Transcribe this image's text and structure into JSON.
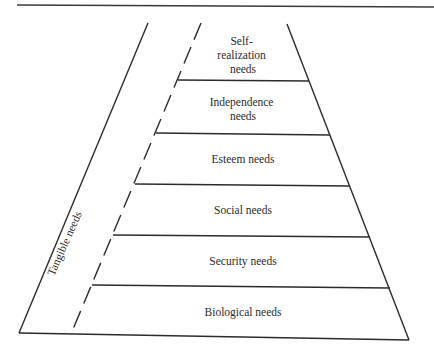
{
  "diagram": {
    "type": "pyramid",
    "colors": {
      "line": "#2b2b2b",
      "text": "#2a2a2a",
      "background": "#ffffff"
    },
    "side_label": "Tangible needs",
    "levels": [
      {
        "id": "self-realization",
        "lines": [
          "Self-",
          "realization",
          "needs"
        ]
      },
      {
        "id": "independence",
        "lines": [
          "Independence",
          "needs"
        ]
      },
      {
        "id": "esteem",
        "lines": [
          "Esteem needs"
        ]
      },
      {
        "id": "social",
        "lines": [
          "Social needs"
        ]
      },
      {
        "id": "security",
        "lines": [
          "Security needs"
        ]
      },
      {
        "id": "biological",
        "lines": [
          "Biological needs"
        ]
      }
    ]
  }
}
